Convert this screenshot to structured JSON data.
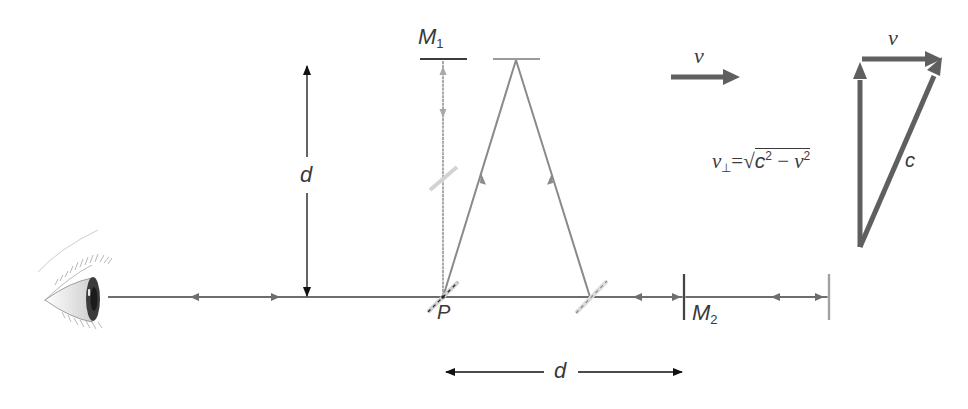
{
  "diagram": {
    "type": "Michelson-Morley interferometer in moving frame",
    "labels": {
      "mirror1": "M",
      "mirror1_sub": "1",
      "mirror2": "M",
      "mirror2_sub": "2",
      "point": "P",
      "vertical_distance": "d",
      "horizontal_distance": "d",
      "velocity": "v",
      "velocity_triangle_top": "v",
      "hypotenuse": "c",
      "perp_lhs": "v",
      "perp_sub": "⊥",
      "equals": "=",
      "sqrt_symbol": "√",
      "radicand_c": "c",
      "radicand_exp1": "2",
      "minus": " − ",
      "radicand_v": "v",
      "radicand_exp2": "2"
    },
    "colors": {
      "beam": "#6e6e6e",
      "beam_light": "#a9a9a9",
      "mirror_dark": "#3c3c3c",
      "mirror_light": "#9a9a9a",
      "vector": "#5f5f5f",
      "dimension": "#111111",
      "text": "#3a3a3a"
    },
    "elements": [
      "eye-observer",
      "beam-splitter-P",
      "mirror-M1",
      "mirror-M2",
      "moved-mirror-M1",
      "moved-beam-splitter",
      "moved-mirror-M2",
      "velocity-arrow",
      "velocity-triangle"
    ]
  }
}
